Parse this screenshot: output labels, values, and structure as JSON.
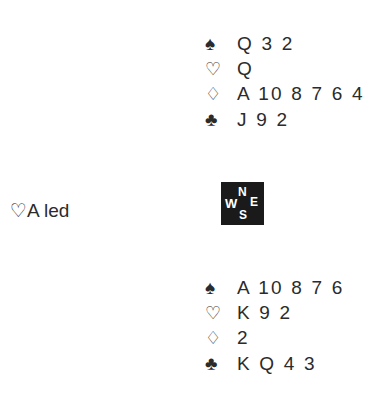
{
  "north": {
    "suits": [
      {
        "suit": "spades",
        "symbol": "♠",
        "cards": "Q 3 2"
      },
      {
        "suit": "hearts",
        "symbol": "♡",
        "cards": "Q"
      },
      {
        "suit": "diamonds",
        "symbol": "♢",
        "cards": "A 10 8 7 6 4"
      },
      {
        "suit": "clubs",
        "symbol": "♣",
        "cards": "J 9 2"
      }
    ]
  },
  "south": {
    "suits": [
      {
        "suit": "spades",
        "symbol": "♠",
        "cards": "A 10 8 7 6"
      },
      {
        "suit": "hearts",
        "symbol": "♡",
        "cards": "K 9 2"
      },
      {
        "suit": "diamonds",
        "symbol": "♢",
        "cards": "2"
      },
      {
        "suit": "clubs",
        "symbol": "♣",
        "cards": "K Q 4 3"
      }
    ]
  },
  "lead": {
    "text": "♡A led"
  },
  "compass": {
    "n": "N",
    "w": "W",
    "e": "E",
    "s": "S"
  },
  "colors": {
    "text": "#2b2b2b",
    "compass_bg": "#1a1a1a",
    "compass_text": "#ffffff"
  }
}
